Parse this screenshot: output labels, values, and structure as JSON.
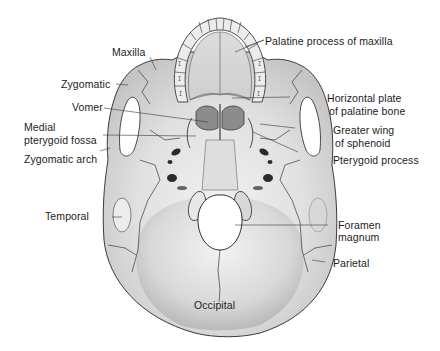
{
  "figure": {
    "view": "inferior",
    "colors": {
      "bone": "#e4e4e4",
      "bone_shadow": "#b9b9b9",
      "outline": "#3a3a3a",
      "label_text": "#1c1c1c",
      "background": "#ffffff"
    }
  },
  "labels": {
    "left": [
      {
        "id": "maxilla",
        "text": "Maxilla"
      },
      {
        "id": "zygomatic",
        "text": "Zygomatic"
      },
      {
        "id": "vomer",
        "text": "Vomer"
      },
      {
        "id": "medial_pterygoid_fossa_1",
        "text": "Medial"
      },
      {
        "id": "medial_pterygoid_fossa_2",
        "text": "pterygoid fossa"
      },
      {
        "id": "zygomatic_arch",
        "text": "Zygomatic arch"
      },
      {
        "id": "temporal",
        "text": "Temporal"
      }
    ],
    "right": [
      {
        "id": "palatine_process",
        "text": "Palatine process of maxilla"
      },
      {
        "id": "horizontal_plate_1",
        "text": "Horizontal plate"
      },
      {
        "id": "horizontal_plate_2",
        "text": "of palatine bone"
      },
      {
        "id": "greater_wing_1",
        "text": "Greater wing"
      },
      {
        "id": "greater_wing_2",
        "text": "of sphenoid"
      },
      {
        "id": "pterygoid_process",
        "text": "Pterygoid process"
      },
      {
        "id": "foramen_magnum_1",
        "text": "Foramen"
      },
      {
        "id": "foramen_magnum_2",
        "text": "magnum"
      },
      {
        "id": "parietal",
        "text": "Parietal"
      }
    ],
    "inner": [
      {
        "id": "occipital",
        "text": "Occipital"
      }
    ]
  }
}
